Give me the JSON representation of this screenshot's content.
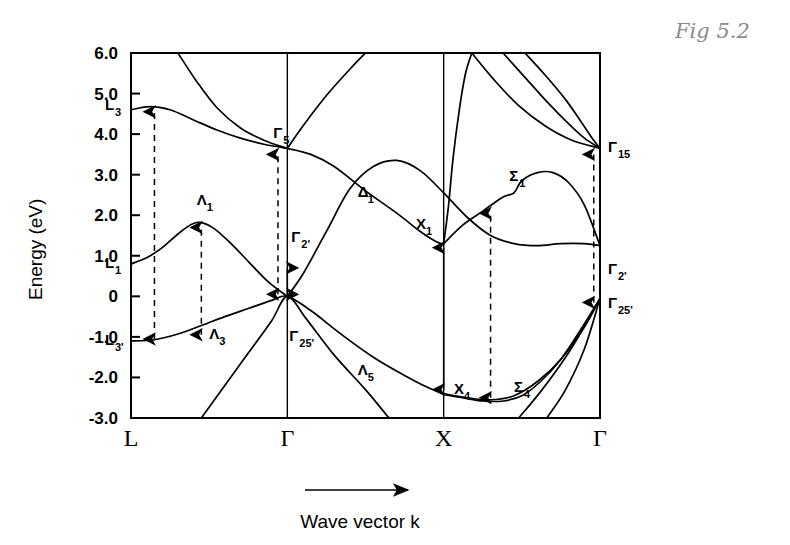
{
  "figure": {
    "annotation": "Fig 5.2",
    "xlabel": "Wave vector k",
    "ylabel": "Energy (eV)"
  },
  "chart_data": {
    "type": "line",
    "title": "",
    "subtitle": "",
    "xlabel": "Wave vector k",
    "ylabel": "Energy (eV)",
    "ylim": [
      -3.0,
      6.0
    ],
    "grid": false,
    "legend": "none",
    "annotation": "Fig 5.2",
    "x_tick_labels": [
      "L",
      "Γ",
      "X",
      "Γ"
    ],
    "x_tick_positions": [
      0.0,
      1.0,
      2.0,
      3.0
    ],
    "y_tick_labels": [
      "6.0",
      "5.0",
      "4.0",
      "3.0",
      "2.0",
      "1.0",
      "0",
      "-1.0",
      "-2.0",
      "-3.0"
    ],
    "y_tick_values": [
      6.0,
      5.0,
      4.0,
      3.0,
      2.0,
      1.0,
      0.0,
      -1.0,
      -2.0,
      -3.0
    ],
    "critical_point_labels": [
      {
        "text": "L",
        "sub": "3",
        "prime": "",
        "x": 0.0,
        "y": 4.6
      },
      {
        "text": "L",
        "sub": "1",
        "prime": "",
        "x": 0.0,
        "y": 0.7
      },
      {
        "text": "L",
        "sub": "3",
        "prime": "'",
        "x": 0.0,
        "y": -1.2
      },
      {
        "text": "Γ",
        "sub": "5",
        "prime": "",
        "x": 1.0,
        "y": 3.75
      },
      {
        "text": "Γ",
        "sub": "2",
        "prime": "'",
        "x": 1.0,
        "y": 1.45
      },
      {
        "text": "Γ",
        "sub": "25",
        "prime": "'",
        "x": 1.0,
        "y": -0.75
      },
      {
        "text": "Λ",
        "sub": "1",
        "prime": "",
        "x": 0.42,
        "y": 2.25
      },
      {
        "text": "Λ",
        "sub": "3",
        "prime": "",
        "x": 0.5,
        "y": -1.05
      },
      {
        "text": "Λ",
        "sub": "5",
        "prime": "",
        "x": 1.45,
        "y": -1.95
      },
      {
        "text": "Δ",
        "sub": "1",
        "prime": "",
        "x": 1.45,
        "y": 2.45
      },
      {
        "text": "X",
        "sub": "1",
        "prime": "",
        "x": 1.9,
        "y": 1.65
      },
      {
        "text": "X",
        "sub": "4",
        "prime": "",
        "x": 2.04,
        "y": -2.3
      },
      {
        "text": "Σ",
        "sub": "1",
        "prime": "",
        "x": 2.42,
        "y": 2.85
      },
      {
        "text": "Σ",
        "sub": "4",
        "prime": "",
        "x": 2.45,
        "y": -2.35
      },
      {
        "text": "Γ",
        "sub": "15",
        "prime": "",
        "x": 3.0,
        "y": 3.65
      },
      {
        "text": "Γ",
        "sub": "2",
        "prime": "'",
        "x": 3.0,
        "y": 0.65
      },
      {
        "text": "Γ",
        "sub": "25",
        "prime": "'",
        "x": 3.0,
        "y": -0.2
      }
    ],
    "series": [
      {
        "name": "valence-band-1",
        "points": [
          [
            0.0,
            -1.1
          ],
          [
            0.15,
            -1.07
          ],
          [
            0.3,
            -0.93
          ],
          [
            0.45,
            -0.72
          ],
          [
            0.6,
            -0.5
          ],
          [
            0.75,
            -0.3
          ],
          [
            0.9,
            -0.1
          ],
          [
            1.0,
            0.0
          ],
          [
            1.15,
            -0.35
          ],
          [
            1.35,
            -0.95
          ],
          [
            1.55,
            -1.5
          ],
          [
            1.75,
            -1.95
          ],
          [
            1.9,
            -2.25
          ],
          [
            2.0,
            -2.4
          ],
          [
            2.15,
            -2.5
          ],
          [
            2.3,
            -2.55
          ],
          [
            2.45,
            -2.45
          ],
          [
            2.6,
            -2.1
          ],
          [
            2.75,
            -1.55
          ],
          [
            2.9,
            -0.75
          ],
          [
            3.0,
            -0.05
          ]
        ]
      },
      {
        "name": "valence-band-2",
        "points": [
          [
            0.45,
            -3.0
          ],
          [
            0.6,
            -2.2
          ],
          [
            0.75,
            -1.4
          ],
          [
            0.9,
            -0.6
          ],
          [
            1.0,
            0.0
          ],
          [
            1.12,
            -0.55
          ],
          [
            1.3,
            -1.45
          ],
          [
            1.5,
            -2.3
          ],
          [
            1.65,
            -3.0
          ]
        ]
      },
      {
        "name": "valence-band-3",
        "points": [
          [
            2.48,
            -3.0
          ],
          [
            2.62,
            -2.35
          ],
          [
            2.78,
            -1.5
          ],
          [
            2.9,
            -0.75
          ],
          [
            3.0,
            -0.05
          ]
        ]
      },
      {
        "name": "valence-band-4",
        "points": [
          [
            2.66,
            -3.0
          ],
          [
            2.78,
            -2.3
          ],
          [
            2.9,
            -1.3
          ],
          [
            3.0,
            -0.05
          ]
        ]
      },
      {
        "name": "conduction-band-delta1",
        "points": [
          [
            1.0,
            0.0
          ],
          [
            1.1,
            0.55
          ],
          [
            1.25,
            1.6
          ],
          [
            1.4,
            2.65
          ],
          [
            1.55,
            3.2
          ],
          [
            1.7,
            3.35
          ],
          [
            1.85,
            3.1
          ],
          [
            2.0,
            2.55
          ],
          [
            2.15,
            1.95
          ],
          [
            2.3,
            1.5
          ],
          [
            2.45,
            1.3
          ],
          [
            2.6,
            1.25
          ],
          [
            2.75,
            1.3
          ],
          [
            2.9,
            1.3
          ],
          [
            3.0,
            1.25
          ]
        ]
      },
      {
        "name": "conduction-band-gamma5-x1",
        "points": [
          [
            1.0,
            3.65
          ],
          [
            1.15,
            3.5
          ],
          [
            1.3,
            3.2
          ],
          [
            1.5,
            2.6
          ],
          [
            1.7,
            2.05
          ],
          [
            1.85,
            1.6
          ],
          [
            1.95,
            1.35
          ],
          [
            2.0,
            1.28
          ]
        ]
      },
      {
        "name": "valence-upper-lambda1",
        "points": [
          [
            0.0,
            0.8
          ],
          [
            0.1,
            0.95
          ],
          [
            0.2,
            1.2
          ],
          [
            0.32,
            1.6
          ],
          [
            0.42,
            1.82
          ],
          [
            0.52,
            1.7
          ],
          [
            0.64,
            1.3
          ],
          [
            0.76,
            0.82
          ],
          [
            0.88,
            0.35
          ],
          [
            1.0,
            0.0
          ]
        ]
      },
      {
        "name": "conduction-lambda-upper",
        "points": [
          [
            0.0,
            4.6
          ],
          [
            0.12,
            4.68
          ],
          [
            0.25,
            4.6
          ],
          [
            0.4,
            4.35
          ],
          [
            0.55,
            4.1
          ],
          [
            0.7,
            3.9
          ],
          [
            0.85,
            3.75
          ],
          [
            1.0,
            3.65
          ]
        ]
      },
      {
        "name": "conduction-steep-left",
        "points": [
          [
            0.3,
            6.0
          ],
          [
            0.42,
            5.3
          ],
          [
            0.55,
            4.65
          ],
          [
            0.7,
            4.15
          ],
          [
            0.85,
            3.85
          ],
          [
            1.0,
            3.65
          ]
        ]
      },
      {
        "name": "conduction-rise-right-of-gamma",
        "points": [
          [
            1.0,
            3.65
          ],
          [
            1.1,
            4.2
          ],
          [
            1.25,
            4.95
          ],
          [
            1.4,
            5.6
          ],
          [
            1.5,
            6.0
          ]
        ]
      },
      {
        "name": "conduction-x-peak",
        "points": [
          [
            2.0,
            1.3
          ],
          [
            2.03,
            2.2
          ],
          [
            2.06,
            3.4
          ],
          [
            2.1,
            4.6
          ],
          [
            2.14,
            5.5
          ],
          [
            2.18,
            6.0
          ]
        ]
      },
      {
        "name": "conduction-sigma1",
        "points": [
          [
            2.0,
            1.3
          ],
          [
            2.12,
            1.75
          ],
          [
            2.25,
            2.1
          ],
          [
            2.38,
            2.45
          ],
          [
            2.45,
            2.55
          ],
          [
            2.5,
            2.85
          ],
          [
            2.6,
            3.05
          ],
          [
            2.7,
            3.05
          ],
          [
            2.8,
            2.8
          ],
          [
            2.9,
            2.25
          ],
          [
            3.0,
            1.25
          ]
        ]
      },
      {
        "name": "conduction-descend-1",
        "points": [
          [
            2.18,
            6.0
          ],
          [
            2.32,
            5.35
          ],
          [
            2.48,
            4.7
          ],
          [
            2.65,
            4.2
          ],
          [
            2.82,
            3.85
          ],
          [
            3.0,
            3.65
          ]
        ]
      },
      {
        "name": "conduction-descend-2",
        "points": [
          [
            2.38,
            6.0
          ],
          [
            2.52,
            5.4
          ],
          [
            2.66,
            4.8
          ],
          [
            2.8,
            4.25
          ],
          [
            2.9,
            3.9
          ],
          [
            3.0,
            3.65
          ]
        ]
      },
      {
        "name": "conduction-descend-3",
        "points": [
          [
            2.52,
            6.0
          ],
          [
            2.65,
            5.45
          ],
          [
            2.78,
            4.85
          ],
          [
            2.88,
            4.3
          ],
          [
            2.95,
            3.9
          ],
          [
            3.0,
            3.65
          ]
        ]
      },
      {
        "name": "valence-sigma4",
        "points": [
          [
            2.0,
            -2.42
          ],
          [
            2.12,
            -2.5
          ],
          [
            2.25,
            -2.58
          ],
          [
            2.38,
            -2.58
          ],
          [
            2.5,
            -2.45
          ],
          [
            2.62,
            -2.1
          ],
          [
            2.75,
            -1.55
          ],
          [
            2.88,
            -0.8
          ],
          [
            3.0,
            -0.05
          ]
        ]
      }
    ],
    "transitions": [
      {
        "name": "L-transition",
        "x": 0.15,
        "y_from": -1.05,
        "y_to": 4.55,
        "style": "dashed",
        "heads": "both"
      },
      {
        "name": "Lambda-transition",
        "x": 0.45,
        "y_from": -0.95,
        "y_to": 1.7,
        "style": "dashed",
        "heads": "both"
      },
      {
        "name": "Gamma-transition",
        "x": 0.94,
        "y_from": 0.05,
        "y_to": 3.5,
        "style": "dashed",
        "heads": "both"
      },
      {
        "name": "Gamma-direct-gap",
        "x": 1.0,
        "y_from": 0.7,
        "y_to": 0.05,
        "style": "solid",
        "heads": "both"
      },
      {
        "name": "X-transition",
        "x": 2.0,
        "y_from": -2.3,
        "y_to": 1.2,
        "style": "solid",
        "heads": "both"
      },
      {
        "name": "Sigma-transition",
        "x": 2.3,
        "y_from": -2.5,
        "y_to": 2.05,
        "style": "dashed",
        "heads": "both"
      },
      {
        "name": "Gamma15-transition",
        "x": 2.96,
        "y_from": -0.15,
        "y_to": 3.5,
        "style": "dashed",
        "heads": "both"
      }
    ]
  }
}
